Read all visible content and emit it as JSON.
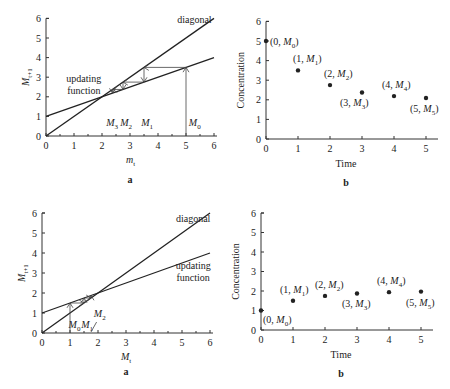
{
  "chart_data": [
    {
      "id": "top-a",
      "panel_label": "a",
      "type": "line",
      "title": "",
      "xlabel": "m_t",
      "ylabel": "M_{t+1}",
      "xlim": [
        0,
        6
      ],
      "ylim": [
        0,
        6
      ],
      "x_ticks": [
        "0",
        "1",
        "2",
        "3",
        "4",
        "5",
        "6"
      ],
      "y_ticks": [
        "0",
        "1",
        "2",
        "3",
        "4",
        "5",
        "6"
      ],
      "grid": false,
      "series": [
        {
          "name": "diagonal",
          "x": [
            0,
            6
          ],
          "y": [
            0,
            6
          ]
        },
        {
          "name": "updating function",
          "x": [
            0,
            6
          ],
          "y": [
            1,
            4
          ]
        }
      ],
      "cobweb": {
        "points": [
          "M_0",
          "M_1",
          "M_2",
          "M_3"
        ],
        "values": [
          5,
          3.5,
          2.75,
          2.375
        ]
      },
      "annotations": [
        "diagonal",
        "updating",
        "function",
        "M_3",
        "M_2",
        "M_1",
        "M_0"
      ]
    },
    {
      "id": "top-b",
      "panel_label": "b",
      "type": "scatter",
      "title": "",
      "xlabel": "Time",
      "ylabel": "Concentration",
      "xlim": [
        0,
        5
      ],
      "ylim": [
        0,
        6
      ],
      "x_ticks": [
        "0",
        "1",
        "2",
        "3",
        "4",
        "5"
      ],
      "y_ticks": [
        "0",
        "1",
        "2",
        "3",
        "4",
        "5",
        "6"
      ],
      "grid": false,
      "x": [
        0,
        1,
        2,
        3,
        4,
        5
      ],
      "values": [
        5,
        3.5,
        2.75,
        2.375,
        2.19,
        2.09
      ],
      "point_labels": [
        "(0, M_0)",
        "(1, M_1)",
        "(2, M_2)",
        "(3, M_3)",
        "(4, M_4)",
        "(5, M_5)"
      ]
    },
    {
      "id": "bottom-a",
      "panel_label": "a",
      "type": "line",
      "title": "",
      "xlabel": "M_t",
      "ylabel": "M_{t+1}",
      "xlim": [
        0,
        6
      ],
      "ylim": [
        0,
        6
      ],
      "x_ticks": [
        "0",
        "1",
        "2",
        "3",
        "4",
        "5",
        "6"
      ],
      "y_ticks": [
        "0",
        "1",
        "2",
        "3",
        "4",
        "5",
        "6"
      ],
      "grid": false,
      "series": [
        {
          "name": "diagonal",
          "x": [
            0,
            6
          ],
          "y": [
            0,
            6
          ]
        },
        {
          "name": "updating function",
          "x": [
            0,
            6
          ],
          "y": [
            1,
            4
          ]
        }
      ],
      "cobweb": {
        "points": [
          "M_0",
          "M_1",
          "M_2"
        ],
        "values": [
          1,
          1.5,
          1.75
        ]
      },
      "annotations": [
        "diagonal",
        "updating",
        "function",
        "M_0",
        "M_1",
        "M_2"
      ]
    },
    {
      "id": "bottom-b",
      "panel_label": "b",
      "type": "scatter",
      "title": "",
      "xlabel": "Time",
      "ylabel": "Concentration",
      "xlim": [
        0,
        5
      ],
      "ylim": [
        0,
        6
      ],
      "x_ticks": [
        "0",
        "1",
        "2",
        "3",
        "4",
        "5"
      ],
      "y_ticks": [
        "0",
        "1",
        "2",
        "3",
        "4",
        "5",
        "6"
      ],
      "grid": false,
      "x": [
        0,
        1,
        2,
        3,
        4,
        5
      ],
      "values": [
        1,
        1.5,
        1.75,
        1.875,
        1.94,
        1.97
      ],
      "point_labels": [
        "(0, M_0)",
        "(1, M_1)",
        "(2, M_2)",
        "(3, M_3)",
        "(4, M_4)",
        "(5, M_5)"
      ]
    }
  ],
  "labels": {
    "diagonal": "diagonal",
    "updating": "updating",
    "function": "function",
    "time": "Time",
    "concentration": "Concentration",
    "panel_a": "a",
    "panel_b": "b",
    "M": "M",
    "m": "m",
    "sub_t": "t",
    "sub_t1": "t+1",
    "open": "(",
    "close": ")",
    "sep": ", ",
    "n0": "0",
    "n1": "1",
    "n2": "2",
    "n3": "3",
    "n4": "4",
    "n5": "5",
    "n6": "6"
  }
}
